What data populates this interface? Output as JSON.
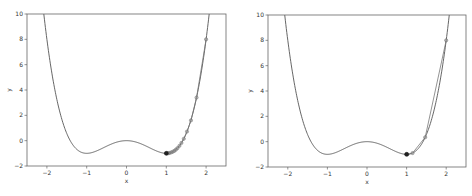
{
  "chart_data": [
    {
      "type": "line",
      "title": "",
      "xlabel": "x",
      "ylabel": "y",
      "xlim": [
        -2.5,
        2.5
      ],
      "ylim": [
        -2,
        10
      ],
      "xticks": [
        "-2",
        "-1",
        "0",
        "1",
        "2"
      ],
      "yticks": [
        "-2",
        "0",
        "2",
        "4",
        "6",
        "8",
        "10"
      ],
      "grid": false,
      "function": "y = x^4 - 2x^2",
      "series": [
        {
          "name": "curve",
          "kind": "line",
          "color": "#555555"
        },
        {
          "name": "iterates",
          "kind": "markers+line",
          "color": "#777777",
          "x": [
            2.0,
            1.76,
            1.62,
            1.52,
            1.44,
            1.38,
            1.33,
            1.28,
            1.24,
            1.2,
            1.16,
            1.12,
            1.08,
            1.05,
            1.02,
            1.0
          ],
          "y": [
            8.0,
            3.4,
            1.6,
            0.72,
            0.15,
            -0.18,
            -0.41,
            -0.59,
            -0.71,
            -0.81,
            -0.88,
            -0.93,
            -0.97,
            -0.99,
            -1.0,
            -1.0
          ]
        }
      ]
    },
    {
      "type": "line",
      "title": "",
      "xlabel": "x",
      "ylabel": "y",
      "xlim": [
        -2.5,
        2.5
      ],
      "ylim": [
        -2,
        10
      ],
      "xticks": [
        "-2",
        "-1",
        "0",
        "1",
        "2"
      ],
      "yticks": [
        "-2",
        "0",
        "2",
        "4",
        "6",
        "8",
        "10"
      ],
      "grid": false,
      "function": "y = x^4 - 2x^2",
      "series": [
        {
          "name": "curve",
          "kind": "line",
          "color": "#555555"
        },
        {
          "name": "iterates",
          "kind": "markers+line",
          "color": "#777777",
          "x": [
            2.0,
            1.47,
            1.15,
            1.02,
            1.0
          ],
          "y": [
            8.0,
            0.35,
            -0.9,
            -1.0,
            -1.0
          ]
        }
      ]
    }
  ]
}
